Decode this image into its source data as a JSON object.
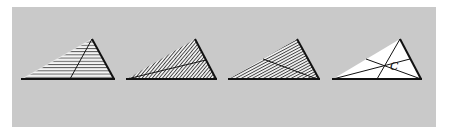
{
  "figure": {
    "background_color": "#c9c9c9",
    "line_color": "#111111",
    "panels": [
      {
        "id": "triangle-1",
        "fill": "horizontal-hatching",
        "segment": "cevian from apex to base"
      },
      {
        "id": "triangle-2",
        "fill": "diagonal-hatching",
        "segment": "median from left vertex to right side"
      },
      {
        "id": "triangle-3",
        "fill": "diagonal-hatching",
        "segment": "median from right vertex to left side"
      },
      {
        "id": "triangle-4",
        "fill": "white",
        "segment": "three medians meeting at centroid",
        "label": "C"
      }
    ]
  }
}
